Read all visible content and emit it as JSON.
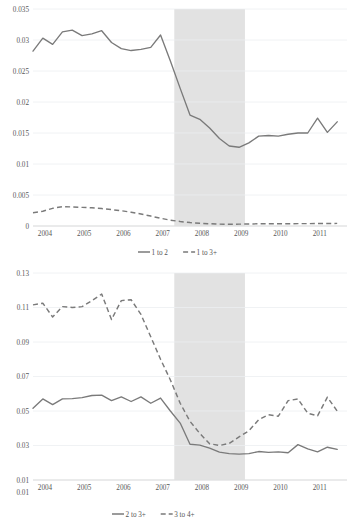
{
  "chart_data": [
    {
      "id": "top",
      "type": "line",
      "title": "",
      "xlabel": "",
      "ylabel": "",
      "ylim": [
        0,
        0.035
      ],
      "ytick_labels": [
        "0",
        "0.005",
        "0.01",
        "0.015",
        "0.02",
        "0.025",
        "0.03",
        "0.035"
      ],
      "ytick_values": [
        0,
        0.005,
        0.01,
        0.015,
        0.02,
        0.025,
        0.03,
        0.035
      ],
      "xtick_labels": [
        "2004",
        "2005",
        "2006",
        "2007",
        "2008",
        "2009",
        "2010",
        "2011"
      ],
      "xlim": [
        2004,
        2012
      ],
      "grid": true,
      "legend_position": "bottom",
      "annotations": [
        {
          "name": "recession-band",
          "type": "vspan",
          "x0": 2007.6,
          "x1": 2009.4,
          "color": "#e2e2e2"
        }
      ],
      "series": [
        {
          "name": "1 to 2",
          "style": "solid",
          "color": "#7a7a7a",
          "x": [
            2004.0,
            2004.25,
            2004.5,
            2004.75,
            2005.0,
            2005.25,
            2005.5,
            2005.75,
            2006.0,
            2006.25,
            2006.5,
            2006.75,
            2007.0,
            2007.25,
            2007.5,
            2007.75,
            2008.0,
            2008.25,
            2008.5,
            2008.75,
            2009.0,
            2009.25,
            2009.5,
            2009.75,
            2010.0,
            2010.25,
            2010.5,
            2010.75,
            2011.0,
            2011.25,
            2011.5,
            2011.75
          ],
          "values": [
            0.0282,
            0.0303,
            0.0293,
            0.0313,
            0.0316,
            0.0307,
            0.031,
            0.0315,
            0.0296,
            0.0286,
            0.0283,
            0.0285,
            0.0288,
            0.0308,
            0.0266,
            0.0222,
            0.0179,
            0.0172,
            0.0158,
            0.0141,
            0.0129,
            0.0127,
            0.0134,
            0.0145,
            0.0146,
            0.0145,
            0.0148,
            0.015,
            0.015,
            0.0174,
            0.0151,
            0.0168
          ]
        },
        {
          "name": "1 to 3+",
          "style": "dashed",
          "color": "#7a7a7a",
          "x": [
            2004.0,
            2004.25,
            2004.5,
            2004.75,
            2005.0,
            2005.25,
            2005.5,
            2005.75,
            2006.0,
            2006.25,
            2006.5,
            2006.75,
            2007.0,
            2007.25,
            2007.5,
            2007.75,
            2008.0,
            2008.25,
            2008.5,
            2008.75,
            2009.0,
            2009.25,
            2009.5,
            2009.75,
            2010.0,
            2010.25,
            2010.5,
            2010.75,
            2011.0,
            2011.25,
            2011.5,
            2011.75
          ],
          "values": [
            0.00215,
            0.00238,
            0.00285,
            0.00313,
            0.00307,
            0.003,
            0.00293,
            0.00281,
            0.00264,
            0.00247,
            0.00222,
            0.00193,
            0.0016,
            0.00125,
            0.00094,
            0.00072,
            0.00055,
            0.00044,
            0.00036,
            0.0003,
            0.00028,
            0.0003,
            0.00033,
            0.00035,
            0.00035,
            0.00036,
            0.00036,
            0.00038,
            0.00038,
            0.0004,
            0.0004,
            0.00042
          ]
        }
      ],
      "legend": [
        {
          "label": "1 to 2",
          "style": "solid"
        },
        {
          "label": "1 to 3+",
          "style": "dashed"
        }
      ]
    },
    {
      "id": "bottom",
      "type": "line",
      "title": "",
      "xlabel": "",
      "ylabel": "",
      "ylim": [
        0.01,
        0.13
      ],
      "ytick_labels": [
        "0.01",
        "0.01",
        "0.03",
        "0.05",
        "0.07",
        "0.09",
        "0.11",
        "0.13"
      ],
      "ytick_values": [
        0.01,
        0.01,
        0.03,
        0.05,
        0.07,
        0.09,
        0.11,
        0.13
      ],
      "xtick_labels": [
        "2004",
        "2005",
        "2006",
        "2007",
        "2008",
        "2009",
        "2010",
        "2011"
      ],
      "xlim": [
        2004,
        2012
      ],
      "grid": true,
      "legend_position": "bottom",
      "annotations": [
        {
          "name": "recession-band",
          "type": "vspan",
          "x0": 2007.6,
          "x1": 2009.4,
          "color": "#e2e2e2"
        }
      ],
      "series": [
        {
          "name": "2 to 3+",
          "style": "solid",
          "color": "#7a7a7a",
          "x": [
            2004.0,
            2004.25,
            2004.5,
            2004.75,
            2005.0,
            2005.25,
            2005.5,
            2005.75,
            2006.0,
            2006.25,
            2006.5,
            2006.75,
            2007.0,
            2007.25,
            2007.5,
            2007.75,
            2008.0,
            2008.25,
            2008.5,
            2008.75,
            2009.0,
            2009.25,
            2009.5,
            2009.75,
            2010.0,
            2010.25,
            2010.5,
            2010.75,
            2011.0,
            2011.25,
            2011.5,
            2011.75
          ],
          "values": [
            0.0516,
            0.057,
            0.0537,
            0.057,
            0.0572,
            0.0578,
            0.059,
            0.0592,
            0.056,
            0.0582,
            0.0555,
            0.0582,
            0.0545,
            0.0575,
            0.05,
            0.043,
            0.0307,
            0.0302,
            0.0285,
            0.0262,
            0.0253,
            0.025,
            0.0253,
            0.0265,
            0.026,
            0.0263,
            0.0258,
            0.0305,
            0.028,
            0.0263,
            0.029,
            0.0278
          ]
        },
        {
          "name": "3 to 4+",
          "style": "dashed",
          "color": "#7a7a7a",
          "x": [
            2004.0,
            2004.25,
            2004.5,
            2004.75,
            2005.0,
            2005.25,
            2005.5,
            2005.75,
            2006.0,
            2006.25,
            2006.5,
            2006.75,
            2007.0,
            2007.25,
            2007.5,
            2007.75,
            2008.0,
            2008.25,
            2008.5,
            2008.75,
            2009.0,
            2009.25,
            2009.5,
            2009.75,
            2010.0,
            2010.25,
            2010.5,
            2010.75,
            2011.0,
            2011.25,
            2011.5,
            2011.75
          ],
          "values": [
            0.1115,
            0.1125,
            0.1045,
            0.1105,
            0.11,
            0.1105,
            0.114,
            0.1178,
            0.103,
            0.114,
            0.1145,
            0.106,
            0.093,
            0.08,
            0.068,
            0.0545,
            0.044,
            0.037,
            0.031,
            0.03,
            0.0312,
            0.035,
            0.0385,
            0.045,
            0.0478,
            0.047,
            0.056,
            0.057,
            0.0487,
            0.0472,
            0.058,
            0.05
          ]
        }
      ],
      "legend": [
        {
          "label": "2 to 3+",
          "style": "solid"
        },
        {
          "label": "3 to 4+",
          "style": "dashed"
        }
      ]
    }
  ]
}
